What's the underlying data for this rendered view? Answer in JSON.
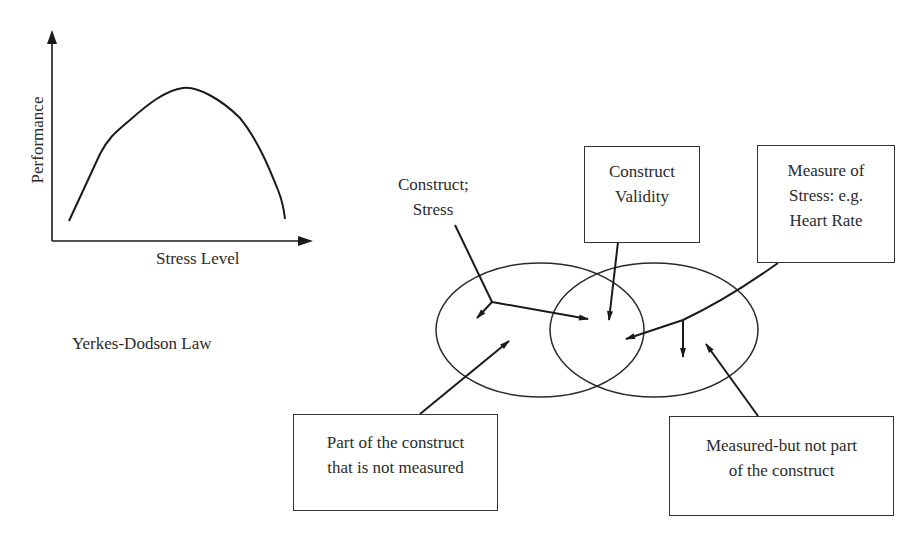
{
  "chart": {
    "ylabel": "Performance",
    "xlabel": "Stress Level",
    "caption": "Yerkes-Dodson Law",
    "curve_type": "inverted-U"
  },
  "diagram": {
    "construct_label_line1": "Construct;",
    "construct_label_line2": "Stress",
    "boxes": {
      "validity": {
        "line1": "Construct",
        "line2": "Validity"
      },
      "measure": {
        "line1": "Measure of",
        "line2": "Stress: e.g.",
        "line3": "Heart Rate"
      },
      "unmeasured": {
        "line1": "Part of the construct",
        "line2": "that is not measured"
      },
      "extraneous": {
        "line1": "Measured-but not part",
        "line2": "of the construct"
      }
    },
    "ellipses": [
      "construct",
      "measure"
    ]
  }
}
